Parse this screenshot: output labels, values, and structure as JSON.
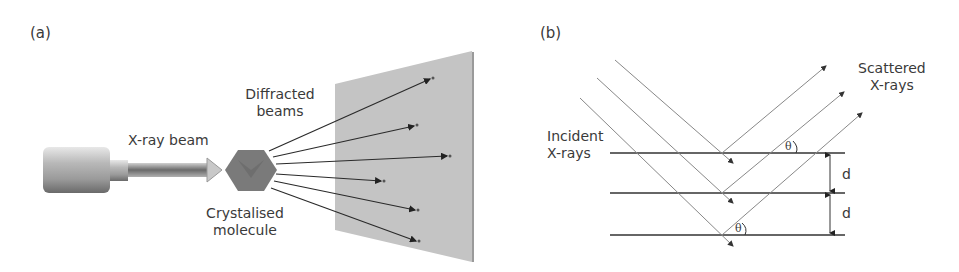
{
  "panel_a": {
    "label": "(a)",
    "x_ray_beam": "X-ray beam",
    "diffracted_line1": "Diffracted",
    "diffracted_line2": "beams",
    "crystal_line1": "Crystalised",
    "crystal_line2": "molecule"
  },
  "panel_b": {
    "label": "(b)",
    "scattered_line1": "Scattered",
    "scattered_line2": "X-rays",
    "incident_line1": "Incident",
    "incident_line2": "X-rays",
    "theta_top": "θ",
    "theta_bottom": "θ",
    "d_upper": "d",
    "d_lower": "d"
  },
  "colors": {
    "screen": "#c4c4c4",
    "crystal": "#7a7a7a",
    "line": "#333333",
    "ray": "#8a8a8a"
  }
}
